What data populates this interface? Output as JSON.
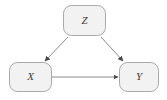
{
  "diagram": {
    "type": "causal-dag",
    "background_color": "#ffffff",
    "node_fill_color": "#f2f2f2",
    "node_border_color": "#a8a8a8",
    "edge_color": "#8c8c8c",
    "arrowhead_color": "#4a4a4a",
    "label_color": "#3a3a3a",
    "nodes": [
      {
        "id": "z",
        "label": "Z",
        "shape": "rounded-rectangle",
        "x": 63,
        "y": 5,
        "width": 43,
        "height": 31,
        "center_x": 84.5,
        "center_y": 20.5
      },
      {
        "id": "x",
        "label": "X",
        "shape": "rounded-rectangle",
        "x": 9,
        "y": 62,
        "width": 43,
        "height": 30,
        "center_x": 30.5,
        "center_y": 77
      },
      {
        "id": "y",
        "label": "Y",
        "shape": "rounded-rectangle",
        "x": 119,
        "y": 62,
        "width": 40,
        "height": 30,
        "center_x": 139,
        "center_y": 77
      }
    ],
    "edges": [
      {
        "id": "z-to-x",
        "from": "z",
        "to": "x",
        "directed": true,
        "x1": 68,
        "y1": 37,
        "x2": 45,
        "y2": 61
      },
      {
        "id": "z-to-y",
        "from": "z",
        "to": "y",
        "directed": true,
        "x1": 101,
        "y1": 37,
        "x2": 123,
        "y2": 61
      },
      {
        "id": "x-to-y",
        "from": "x",
        "to": "y",
        "directed": true,
        "x1": 52,
        "y1": 77,
        "x2": 118,
        "y2": 77
      }
    ]
  }
}
